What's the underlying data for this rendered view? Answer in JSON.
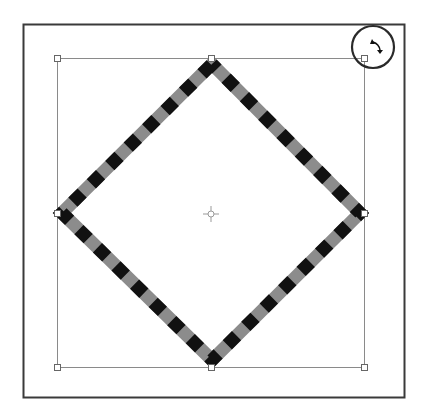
{
  "canvas": {
    "background": "#ffffff",
    "frame_color": "#3a3a3a",
    "bbox_color": "#8a8a8a"
  },
  "shape": {
    "type": "diamond",
    "stroke_dash_colors": [
      "#111111",
      "#8c8c8c"
    ]
  },
  "icons": {
    "rotate": "rotate-cursor-icon",
    "center": "center-point-icon"
  }
}
